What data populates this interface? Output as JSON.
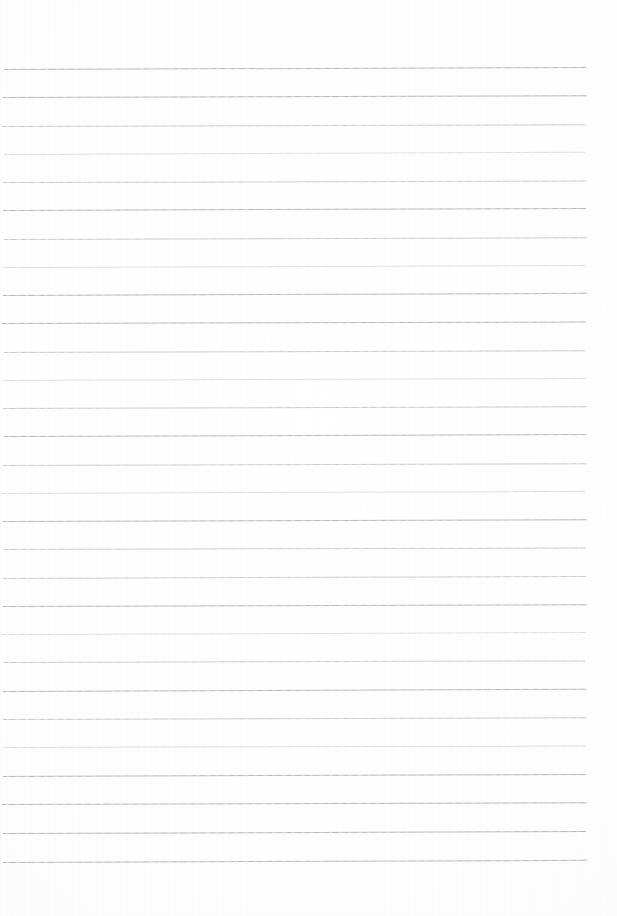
{
  "document": {
    "kind": "scanned-blank-ruled-paper",
    "page_background_color": "#fefefe",
    "rule_color": "#b9bdc2",
    "written_text": "",
    "page_width": 617,
    "page_height": 916
  },
  "ruling": {
    "line_count": 29,
    "first_line_y": 69,
    "line_spacing": 28.3,
    "left_margin": 3,
    "right_edge": 587,
    "line_thickness": 1,
    "slant_degrees": -0.18,
    "margin_rule_present": false,
    "holes_present": false
  },
  "lines": [
    {
      "index": 1,
      "y": 69,
      "x_start": 4,
      "x_end": 586,
      "weight": "dark",
      "slant": -0.2
    },
    {
      "index": 2,
      "y": 97,
      "x_start": 3,
      "x_end": 587,
      "weight": "dark",
      "slant": -0.18
    },
    {
      "index": 3,
      "y": 126,
      "x_start": 2,
      "x_end": 586,
      "weight": "normal",
      "slant": -0.16
    },
    {
      "index": 4,
      "y": 154,
      "x_start": 4,
      "x_end": 585,
      "weight": "soft",
      "slant": -0.22
    },
    {
      "index": 5,
      "y": 182,
      "x_start": 3,
      "x_end": 586,
      "weight": "normal",
      "slant": -0.14
    },
    {
      "index": 6,
      "y": 210,
      "x_start": 3,
      "x_end": 586,
      "weight": "dark",
      "slant": -0.2
    },
    {
      "index": 7,
      "y": 239,
      "x_start": 4,
      "x_end": 587,
      "weight": "normal",
      "slant": -0.17
    },
    {
      "index": 8,
      "y": 267,
      "x_start": 3,
      "x_end": 586,
      "weight": "soft",
      "slant": -0.19
    },
    {
      "index": 9,
      "y": 295,
      "x_start": 3,
      "x_end": 587,
      "weight": "dark",
      "slant": -0.21
    },
    {
      "index": 10,
      "y": 323,
      "x_start": 2,
      "x_end": 586,
      "weight": "dark",
      "slant": -0.15
    },
    {
      "index": 11,
      "y": 352,
      "x_start": 4,
      "x_end": 585,
      "weight": "normal",
      "slant": -0.18
    },
    {
      "index": 12,
      "y": 380,
      "x_start": 3,
      "x_end": 586,
      "weight": "soft",
      "slant": -0.2
    },
    {
      "index": 13,
      "y": 408,
      "x_start": 3,
      "x_end": 587,
      "weight": "normal",
      "slant": -0.16
    },
    {
      "index": 14,
      "y": 436,
      "x_start": 4,
      "x_end": 586,
      "weight": "dark",
      "slant": -0.19
    },
    {
      "index": 15,
      "y": 465,
      "x_start": 3,
      "x_end": 586,
      "weight": "normal",
      "slant": -0.17
    },
    {
      "index": 16,
      "y": 493,
      "x_start": 2,
      "x_end": 585,
      "weight": "soft",
      "slant": -0.21
    },
    {
      "index": 17,
      "y": 521,
      "x_start": 3,
      "x_end": 587,
      "weight": "dark",
      "slant": -0.18
    },
    {
      "index": 18,
      "y": 549,
      "x_start": 4,
      "x_end": 586,
      "weight": "normal",
      "slant": -0.15
    },
    {
      "index": 19,
      "y": 578,
      "x_start": 3,
      "x_end": 586,
      "weight": "normal",
      "slant": -0.2
    },
    {
      "index": 20,
      "y": 606,
      "x_start": 3,
      "x_end": 587,
      "weight": "dark",
      "slant": -0.17
    },
    {
      "index": 21,
      "y": 634,
      "x_start": 2,
      "x_end": 586,
      "weight": "soft",
      "slant": -0.19
    },
    {
      "index": 22,
      "y": 662,
      "x_start": 4,
      "x_end": 585,
      "weight": "normal",
      "slant": -0.16
    },
    {
      "index": 23,
      "y": 691,
      "x_start": 3,
      "x_end": 586,
      "weight": "dark",
      "slant": -0.22
    },
    {
      "index": 24,
      "y": 719,
      "x_start": 3,
      "x_end": 587,
      "weight": "normal",
      "slant": -0.18
    },
    {
      "index": 25,
      "y": 747,
      "x_start": 4,
      "x_end": 586,
      "weight": "soft",
      "slant": -0.15
    },
    {
      "index": 26,
      "y": 776,
      "x_start": 3,
      "x_end": 586,
      "weight": "dark",
      "slant": -0.2
    },
    {
      "index": 27,
      "y": 804,
      "x_start": 2,
      "x_end": 587,
      "weight": "dark",
      "slant": -0.18
    },
    {
      "index": 28,
      "y": 833,
      "x_start": 3,
      "x_end": 586,
      "weight": "dark",
      "slant": -0.19
    },
    {
      "index": 29,
      "y": 862,
      "x_start": 3,
      "x_end": 587,
      "weight": "dark",
      "slant": -0.21
    }
  ]
}
